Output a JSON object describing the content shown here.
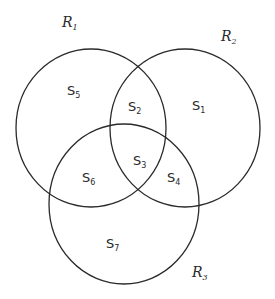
{
  "diagram": {
    "type": "venn",
    "sets": [
      {
        "id": "R1",
        "label": "R",
        "subscript": "1",
        "cx": 91,
        "cy": 128,
        "rx": 75,
        "ry": 79
      },
      {
        "id": "R2",
        "label": "R",
        "subscript": "2",
        "cx": 185,
        "cy": 128,
        "rx": 75,
        "ry": 79
      },
      {
        "id": "R3",
        "label": "R",
        "subscript": "3",
        "cx": 124,
        "cy": 204,
        "rx": 75,
        "ry": 80
      }
    ],
    "set_labels": {
      "R1": {
        "x": 62,
        "y": 27
      },
      "R2": {
        "x": 221,
        "y": 41
      },
      "R3": {
        "x": 192,
        "y": 277
      }
    },
    "regions": [
      {
        "id": "S1",
        "label": "S",
        "subscript": "1",
        "x": 192,
        "y": 110,
        "members": [
          "R2"
        ]
      },
      {
        "id": "S2",
        "label": "S",
        "subscript": "2",
        "x": 128,
        "y": 111,
        "members": [
          "R1",
          "R2"
        ]
      },
      {
        "id": "S3",
        "label": "S",
        "subscript": "3",
        "x": 133,
        "y": 165,
        "members": [
          "R1",
          "R2",
          "R3"
        ]
      },
      {
        "id": "S4",
        "label": "S",
        "subscript": "4",
        "x": 167,
        "y": 182,
        "members": [
          "R2",
          "R3"
        ]
      },
      {
        "id": "S5",
        "label": "S",
        "subscript": "5",
        "x": 67,
        "y": 95,
        "members": [
          "R1"
        ]
      },
      {
        "id": "S6",
        "label": "S",
        "subscript": "6",
        "x": 82,
        "y": 182,
        "members": [
          "R1",
          "R3"
        ]
      },
      {
        "id": "S7",
        "label": "S",
        "subscript": "7",
        "x": 106,
        "y": 248,
        "members": [
          "R3"
        ]
      }
    ]
  }
}
